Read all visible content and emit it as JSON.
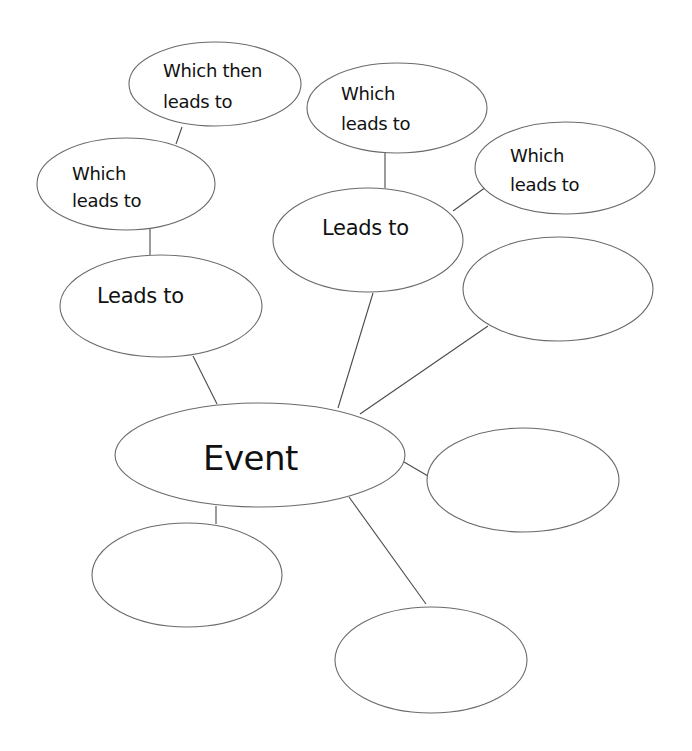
{
  "diagram": {
    "type": "cause-effect bubble map",
    "center": {
      "id": "event",
      "label": "Event"
    },
    "nodes": {
      "event": {
        "lines": [
          "Event"
        ]
      },
      "left_leads_to": {
        "lines": [
          "Leads to"
        ]
      },
      "left_which_leads_to": {
        "lines": [
          "Which",
          "leads to"
        ]
      },
      "left_which_then_leads_to": {
        "lines": [
          "Which then",
          "leads to"
        ]
      },
      "center_leads_to": {
        "lines": [
          "Leads to"
        ]
      },
      "top_which_leads_to": {
        "lines": [
          "Which",
          "leads to"
        ]
      },
      "right_which_leads_to": {
        "lines": [
          "Which",
          "leads to"
        ]
      },
      "blank_right_upper": {
        "lines": []
      },
      "blank_right_lower": {
        "lines": []
      },
      "blank_bottom_left": {
        "lines": []
      },
      "blank_bottom": {
        "lines": []
      }
    },
    "edges": [
      [
        "left_which_then_leads_to",
        "left_which_leads_to"
      ],
      [
        "left_which_leads_to",
        "left_leads_to"
      ],
      [
        "left_leads_to",
        "event"
      ],
      [
        "top_which_leads_to",
        "center_leads_to"
      ],
      [
        "center_leads_to",
        "right_which_leads_to"
      ],
      [
        "center_leads_to",
        "event"
      ],
      [
        "blank_right_upper",
        "event"
      ],
      [
        "event",
        "blank_right_lower"
      ],
      [
        "event",
        "blank_bottom_left"
      ],
      [
        "event",
        "blank_bottom"
      ]
    ],
    "colors": {
      "stroke": "#6a6a6a",
      "text": "#111111",
      "background": "#ffffff"
    }
  }
}
